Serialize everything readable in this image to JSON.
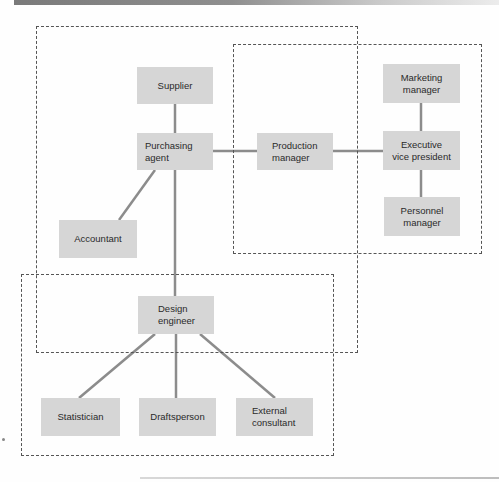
{
  "diagram": {
    "type": "organizational-network",
    "colors": {
      "node_fill": "#d6d6d6",
      "link": "#8c8c8c",
      "group_border": "#555555",
      "node_text": "#2a2a2a"
    },
    "nodes": {
      "supplier": "Supplier",
      "purchasing_agent": "Purchasing\nagent",
      "production_manager": "Production\nmanager",
      "marketing_manager": "Marketing\nmanager",
      "executive_vp": "Executive\nvice president",
      "personnel_manager": "Personnel\nmanager",
      "accountant": "Accountant",
      "design_engineer": "Design\nengineer",
      "statistician": "Statistician",
      "draftsperson": "Draftsperson",
      "external_consultant": "External\nconsultant"
    },
    "links": [
      [
        "supplier",
        "purchasing_agent"
      ],
      [
        "purchasing_agent",
        "production_manager"
      ],
      [
        "production_manager",
        "executive_vp"
      ],
      [
        "marketing_manager",
        "executive_vp"
      ],
      [
        "executive_vp",
        "personnel_manager"
      ],
      [
        "purchasing_agent",
        "accountant"
      ],
      [
        "purchasing_agent",
        "design_engineer"
      ],
      [
        "design_engineer",
        "statistician"
      ],
      [
        "design_engineer",
        "draftsperson"
      ],
      [
        "design_engineer",
        "external_consultant"
      ]
    ],
    "groups": [
      {
        "id": "purchasing-group",
        "style": "dashed"
      },
      {
        "id": "production-group",
        "style": "dashed"
      },
      {
        "id": "design-group",
        "style": "dashed"
      }
    ]
  }
}
